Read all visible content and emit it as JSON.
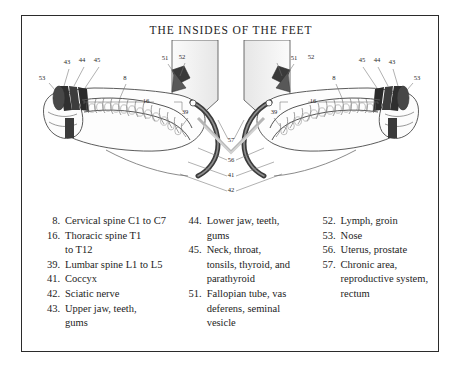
{
  "title": "THE INSIDES OF THE FEET",
  "legend": {
    "columns": [
      {
        "entries": [
          {
            "num": "8.",
            "lines": [
              "Cervical spine C1 to C7"
            ]
          },
          {
            "num": "16.",
            "lines": [
              "Thoracic spine T1",
              "to T12"
            ]
          },
          {
            "num": "39.",
            "lines": [
              "Lumbar spine L1 to L5"
            ]
          },
          {
            "num": "41.",
            "lines": [
              "Coccyx"
            ]
          },
          {
            "num": "42.",
            "lines": [
              "Sciatic nerve"
            ]
          },
          {
            "num": "43.",
            "lines": [
              "Upper jaw, teeth,",
              "gums"
            ]
          }
        ]
      },
      {
        "entries": [
          {
            "num": "44.",
            "lines": [
              "Lower jaw, teeth,",
              "gums"
            ]
          },
          {
            "num": "45.",
            "lines": [
              "Neck, throat,",
              "tonsils, thyroid, and",
              "parathyroid"
            ]
          },
          {
            "num": "51.",
            "lines": [
              "Fallopian tube, vas",
              "deferens, seminal",
              "vesicle"
            ]
          }
        ]
      },
      {
        "entries": [
          {
            "num": "52.",
            "lines": [
              "Lymph, groin"
            ]
          },
          {
            "num": "53.",
            "lines": [
              "Nose"
            ]
          },
          {
            "num": "56.",
            "lines": [
              "Uterus, prostate"
            ]
          },
          {
            "num": "57.",
            "lines": [
              "Chronic area,",
              "reproductive system,",
              "rectum"
            ]
          }
        ]
      }
    ]
  },
  "diagram": {
    "callouts": {
      "left_foot": [
        {
          "id": "c53L",
          "label": "53",
          "x": 20,
          "y": 40
        },
        {
          "id": "c43L",
          "label": "43",
          "x": 45,
          "y": 24
        },
        {
          "id": "c44L",
          "label": "44",
          "x": 60,
          "y": 22
        },
        {
          "id": "c45L",
          "label": "45",
          "x": 75,
          "y": 22
        },
        {
          "id": "c8L",
          "label": "8",
          "x": 103,
          "y": 40
        },
        {
          "id": "c16L",
          "label": "16",
          "x": 124,
          "y": 63
        },
        {
          "id": "c39L",
          "label": "39",
          "x": 163,
          "y": 74
        },
        {
          "id": "c51L",
          "label": "51",
          "x": 143,
          "y": 20
        },
        {
          "id": "c52L",
          "label": "52",
          "x": 160,
          "y": 19
        }
      ],
      "center": [
        {
          "id": "c57",
          "label": "57",
          "x": 209,
          "y": 102
        },
        {
          "id": "c56",
          "label": "56",
          "x": 209,
          "y": 122
        },
        {
          "id": "c41",
          "label": "41",
          "x": 209,
          "y": 137
        },
        {
          "id": "c42",
          "label": "42",
          "x": 209,
          "y": 152
        }
      ],
      "right_foot": [
        {
          "id": "c51R",
          "label": "51",
          "x": 272,
          "y": 20
        },
        {
          "id": "c52R",
          "label": "52",
          "x": 289,
          "y": 19
        },
        {
          "id": "c39R",
          "label": "39",
          "x": 252,
          "y": 74
        },
        {
          "id": "c16R",
          "label": "16",
          "x": 291,
          "y": 63
        },
        {
          "id": "c8R",
          "label": "8",
          "x": 312,
          "y": 40
        },
        {
          "id": "c45R",
          "label": "45",
          "x": 340,
          "y": 22
        },
        {
          "id": "c44R",
          "label": "44",
          "x": 355,
          "y": 22
        },
        {
          "id": "c43R",
          "label": "43",
          "x": 370,
          "y": 24
        },
        {
          "id": "c53R",
          "label": "53",
          "x": 395,
          "y": 40
        }
      ]
    }
  },
  "colors": {
    "frame": "#2b2b2b",
    "ink": "#1d1d1d",
    "band_dark": "#2e2e2e",
    "band_mid": "#6e6e6e",
    "band_light": "#b9b9b9",
    "outline": "#4a4a4a",
    "leader": "#6a6a6a",
    "paper": "#ffffff"
  }
}
